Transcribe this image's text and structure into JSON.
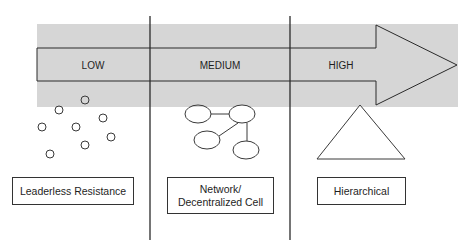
{
  "scale": {
    "levels": [
      {
        "label": "LOW"
      },
      {
        "label": "MEDIUM"
      },
      {
        "label": "HIGH"
      }
    ]
  },
  "structures": [
    {
      "label": "Leaderless Resistance",
      "icon": "scattered-circles-icon"
    },
    {
      "label_line1": "Network/",
      "label_line2": "Decentralized Cell",
      "icon": "network-nodes-icon"
    },
    {
      "label": "Hierarchical",
      "icon": "triangle-icon"
    }
  ],
  "colors": {
    "band": "#d6d6d6",
    "stroke": "#2a2a2a",
    "background": "#ffffff"
  }
}
